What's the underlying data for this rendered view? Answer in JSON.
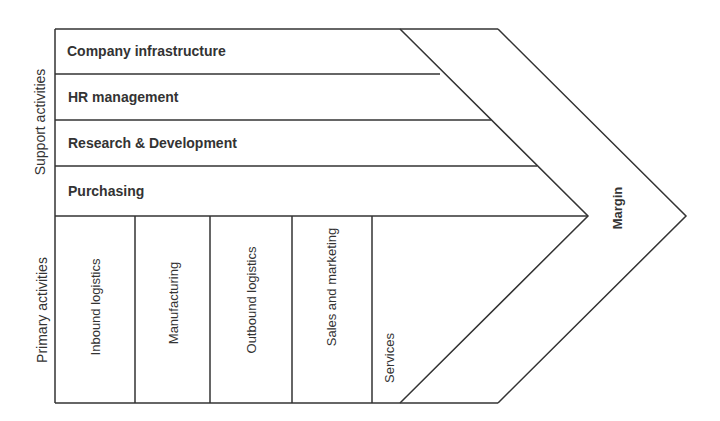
{
  "diagram": {
    "type": "value-chain",
    "side_labels": {
      "support": "Support activities",
      "primary": "Primary activities"
    },
    "support_activities": [
      {
        "label": "Company infrastructure"
      },
      {
        "label": "HR management"
      },
      {
        "label": "Research & Development"
      },
      {
        "label": "Purchasing"
      }
    ],
    "primary_activities": [
      {
        "label": "Inbound logistics"
      },
      {
        "label": "Manufacturing"
      },
      {
        "label": "Outbound logistics"
      },
      {
        "label": "Sales and marketing"
      },
      {
        "label": "Services"
      }
    ],
    "margin_label": "Margin",
    "colors": {
      "line": "#333333",
      "text": "#333333",
      "background": "#ffffff"
    }
  }
}
